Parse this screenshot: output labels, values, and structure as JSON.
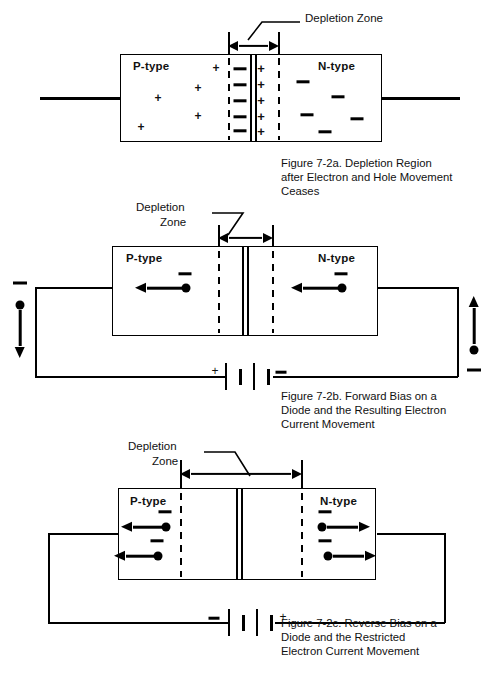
{
  "figures": [
    {
      "id": "7-2a",
      "depletion_label": "Depletion Zone",
      "p_label": "P-type",
      "n_label": "N-type",
      "caption": "Figure 7-2a.  Depletion Region after Electron and Hole Movement Ceases",
      "caption_lines": [
        "Figure 7-2a.  Depletion Region",
        "after Electron and Hole Movement",
        "Ceases"
      ],
      "junction_p_side_charge": "minus",
      "junction_n_side_charge": "plus",
      "junction_charge_count": 5,
      "p_free_charges": "plus",
      "p_free_count": 6,
      "n_free_charges": "minus",
      "n_free_count": 5
    },
    {
      "id": "7-2b",
      "depletion_label_lines": [
        "Depletion",
        "Zone"
      ],
      "p_label": "P-type",
      "n_label": "N-type",
      "caption_lines": [
        "Figure 7-2b.  Forward Bias on a",
        "Diode and the Resulting Electron",
        "Current Movement"
      ],
      "battery_left_sign": "+",
      "battery_right_sign": "-",
      "left_terminal_sign": "-",
      "left_terminal_arrow": "down",
      "right_terminal_sign": "-",
      "right_terminal_arrow": "up",
      "p_electron_direction": "left",
      "n_electron_direction": "left",
      "electron_count": 2,
      "depletion_width_px": 55
    },
    {
      "id": "7-2c",
      "depletion_label_lines": [
        "Depletion",
        "Zone"
      ],
      "p_label": "P-type",
      "n_label": "N-type",
      "caption_lines": [
        "Figure 7-2c.  Reverse Bias on a",
        "Diode and the Restricted",
        "Electron Current Movement"
      ],
      "battery_left_sign": "-",
      "battery_right_sign": "+",
      "p_electron_direction": "left",
      "n_electron_direction": "right",
      "electron_count": 4,
      "depletion_width_px": 125
    }
  ],
  "colors": {
    "ink": "#000000",
    "paper": "#ffffff"
  }
}
